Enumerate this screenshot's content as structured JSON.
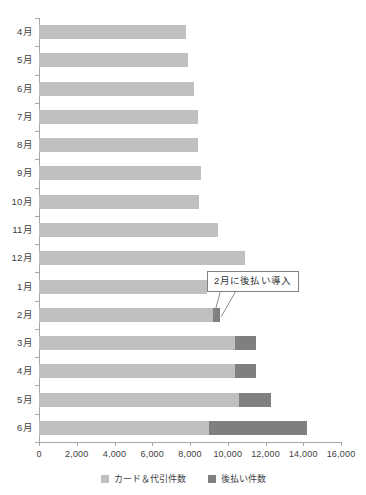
{
  "chart_data": {
    "type": "bar",
    "orientation": "horizontal",
    "stacked": true,
    "title": "",
    "xlabel": "",
    "ylabel": "",
    "xlim": [
      0,
      16000
    ],
    "xticks": [
      0,
      2000,
      4000,
      6000,
      8000,
      10000,
      12000,
      14000,
      16000
    ],
    "xtick_labels": [
      "0",
      "2,000",
      "4,000",
      "6,000",
      "8,000",
      "10,000",
      "12,000",
      "14,000",
      "16,000"
    ],
    "grid": false,
    "legend_position": "bottom",
    "categories": [
      "4月",
      "5月",
      "6月",
      "7月",
      "8月",
      "9月",
      "10月",
      "11月",
      "12月",
      "1月",
      "2月",
      "3月",
      "4月",
      "5月",
      "6月"
    ],
    "series": [
      {
        "name": "カード＆代引件数",
        "color": "#bfbfbf",
        "values": [
          7800,
          7900,
          8200,
          8400,
          8400,
          8600,
          8500,
          9500,
          10900,
          8900,
          9200,
          10400,
          10400,
          10600,
          9000
        ]
      },
      {
        "name": "後払い件数",
        "color": "#7f7f7f",
        "values": [
          0,
          0,
          0,
          0,
          0,
          0,
          0,
          0,
          0,
          0,
          400,
          1100,
          1100,
          1700,
          5200
        ]
      }
    ],
    "annotations": [
      {
        "text": "2月に後払い導入",
        "target_category": "2月",
        "target_series": "後払い件数"
      }
    ]
  },
  "legend": {
    "items": [
      {
        "label": "カード＆代引件数",
        "color": "#bfbfbf",
        "swatch_name": "legend-swatch-card"
      },
      {
        "label": "後払い件数",
        "color": "#7f7f7f",
        "swatch_name": "legend-swatch-deferred"
      }
    ]
  },
  "annotation": {
    "label": "2月に後払い導入"
  },
  "colors": {
    "card_series": "#bfbfbf",
    "deferred_series": "#7f7f7f",
    "axis": "#a6a6a6",
    "text": "#404040",
    "callout_border": "#808080",
    "background": "#ffffff"
  }
}
